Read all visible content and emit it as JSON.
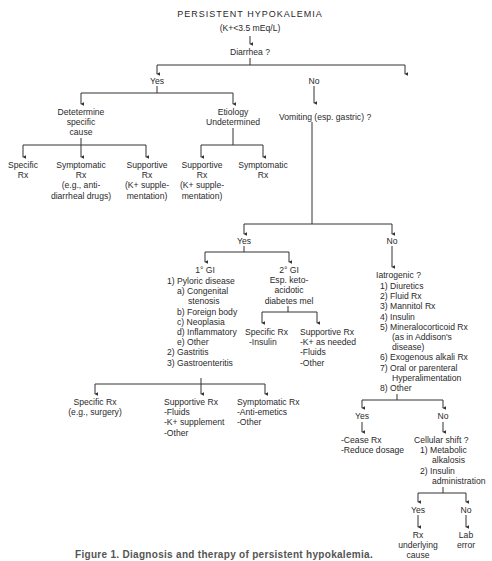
{
  "title": "PERSISTENT HYPOKALEMIA",
  "subtitle": "(K+<3.5 mEq/L)",
  "q_diarrhea": "Diarrhea ?",
  "yes": "Yes",
  "no": "No",
  "diarrhea_yes": {
    "determine": [
      "Detetermine",
      "specific",
      "cause"
    ],
    "undetermined": [
      "Etiology",
      "Undetermined"
    ],
    "determine_children": [
      {
        "lines": [
          "Specific",
          "Rx"
        ]
      },
      {
        "lines": [
          "Symptomatic",
          "Rx",
          "(e.g., anti-",
          "diarrheal drugs)"
        ]
      },
      {
        "lines": [
          "Supportive",
          "Rx",
          "(K+ supple-",
          "mentation)"
        ]
      }
    ],
    "undetermined_children": [
      {
        "lines": [
          "Supportive",
          "Rx",
          "(K+ supple-",
          "mentation)"
        ]
      },
      {
        "lines": [
          "Symptomatic",
          "Rx"
        ]
      }
    ]
  },
  "q_vomiting": "Vomiting (esp. gastric) ?",
  "vomiting_yes": {
    "primary": {
      "heading": "1° GI",
      "items": [
        "1) Pyloric disease",
        "a) Congenital",
        "stenosis",
        "b) Foreign body",
        "c) Neoplasia",
        "d) Inflammatory",
        "e) Other",
        "2) Gastritis",
        "3) Gastroenteritis"
      ]
    },
    "secondary": {
      "heading": "2° GI",
      "lines": [
        "Esp. keto-",
        "acidotic",
        "diabetes mel"
      ],
      "specific": [
        "Specific Rx",
        "-Insulin"
      ],
      "supportive": [
        "Supportive Rx",
        "-K+ as needed",
        "-Fluids",
        "-Other"
      ]
    },
    "primary_children": [
      {
        "lines": [
          "Specific Rx",
          "(e.g., surgery)"
        ]
      },
      {
        "lines": [
          "Supportive Rx",
          "-Fluids",
          "-K+ supplement",
          "-Other"
        ]
      },
      {
        "lines": [
          "Symptomatic Rx",
          "-Anti-emetics",
          "-Other"
        ]
      }
    ]
  },
  "vomiting_no": {
    "question": "Iatrogenic ?",
    "items": [
      "1) Diuretics",
      "2) Fluid Rx",
      "3) Mannitol Rx",
      "4) Insulin",
      "5) Mineralocorticoid Rx",
      "(as in Addison's",
      "disease)",
      "6) Exogenous alkali Rx",
      "7) Oral or parenteral",
      "Hyperalimentation",
      "8) Other"
    ],
    "yes_actions": [
      "-Cease Rx",
      "-Reduce dosage"
    ],
    "cellular_shift": {
      "question": "Cellular shift ?",
      "items": [
        "1) Metabolic",
        "alkalosis",
        "2) Insulin",
        "administration"
      ],
      "yes_result": [
        "Rx",
        "underlying",
        "cause"
      ],
      "no_result": [
        "Lab",
        "error"
      ]
    }
  },
  "caption": "Figure 1. Diagnosis and therapy of persistent hypokalemia."
}
